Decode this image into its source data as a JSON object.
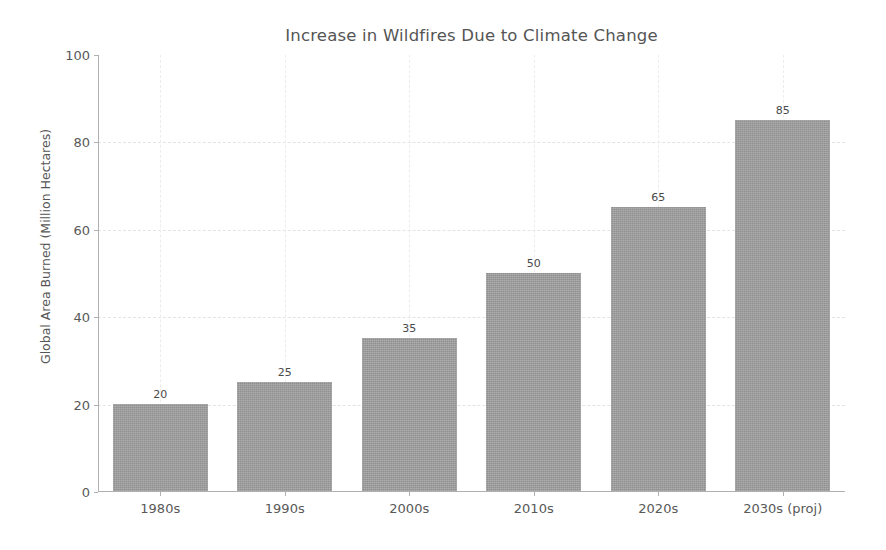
{
  "chart_data": {
    "type": "bar",
    "title": "Increase in Wildfires Due to Climate Change",
    "xlabel": "",
    "ylabel": "Global Area Burned (Million Hectares)",
    "categories": [
      "1980s",
      "1990s",
      "2000s",
      "2010s",
      "2020s",
      "2030s (proj)"
    ],
    "values": [
      20,
      25,
      35,
      50,
      65,
      85
    ],
    "value_labels": [
      "20",
      "25",
      "35",
      "50",
      "65",
      "85"
    ],
    "ylim": [
      0,
      100
    ],
    "yticks": [
      0,
      20,
      40,
      60,
      80,
      100
    ],
    "ytick_labels": [
      "0",
      "20",
      "40",
      "60",
      "80",
      "100"
    ],
    "grid": true,
    "grid_axis": "both",
    "grid_style": "dashed",
    "legend": false,
    "legend_position": "none",
    "bar_color": "#9a9a9a",
    "background_color": "#ffffff",
    "text_color": "#555555",
    "grid_color": "#e3e3e3",
    "axis_color": "#b0b0b0"
  }
}
